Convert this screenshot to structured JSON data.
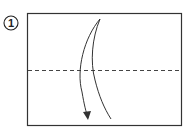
{
  "diagram": {
    "type": "origami-step",
    "step_number": "1",
    "paper": {
      "x": 27,
      "y": 13,
      "width": 154,
      "height": 113,
      "stroke": "#333333",
      "fill": "#ffffff"
    },
    "fold_line": {
      "style": "valley-fold-dashed",
      "y": 70,
      "stroke": "#444444"
    },
    "arrow": {
      "direction": "fold-top-down",
      "stroke": "#333333"
    }
  }
}
